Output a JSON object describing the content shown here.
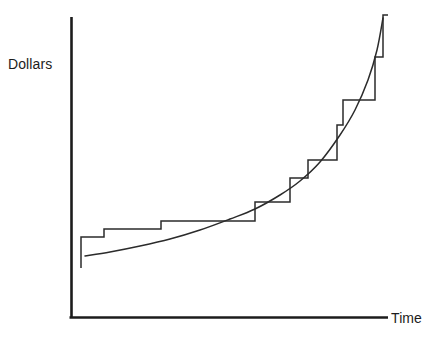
{
  "chart_data": {
    "type": "line",
    "title": "",
    "subtitle": "",
    "xlabel": "Time",
    "ylabel": "Dollars",
    "grid": false,
    "legend": null,
    "axis": {
      "x_range_px": [
        71,
        388
      ],
      "y_range_px": [
        318,
        17
      ],
      "ticks_shown": false,
      "tick_labels_x": [],
      "tick_labels_y": []
    },
    "annotations": [],
    "series": [
      {
        "name": "smooth-growth-curve",
        "type": "line",
        "style": "smooth",
        "color": "#2b2b2b",
        "x": [
          85,
          110,
          140,
          170,
          200,
          230,
          255,
          280,
          300,
          320,
          340,
          355,
          368,
          377,
          383
        ],
        "y": [
          256,
          252,
          246,
          239,
          230,
          219,
          209,
          195,
          181,
          162,
          135,
          110,
          80,
          50,
          18
        ]
      },
      {
        "name": "step-function",
        "type": "step",
        "style": "staircase",
        "color": "#2b2b2b",
        "step_edges_x": [
          81,
          104,
          161,
          255,
          290,
          308,
          337,
          343,
          375,
          383,
          388
        ],
        "step_levels_y": [
          237,
          229,
          221,
          202,
          178,
          160,
          125,
          100,
          57,
          15
        ],
        "start_stub": {
          "x": 81,
          "y_from": 268,
          "y_to": 237
        },
        "end_stub": {
          "x": 383,
          "y_from": 57,
          "y_to": 15
        }
      }
    ]
  },
  "labels": {
    "y_axis": "Dollars",
    "x_axis": "Time"
  },
  "colors": {
    "line": "#2b2b2b",
    "axis": "#1c1c1c",
    "background": "#ffffff",
    "text": "#1c1c1c"
  }
}
